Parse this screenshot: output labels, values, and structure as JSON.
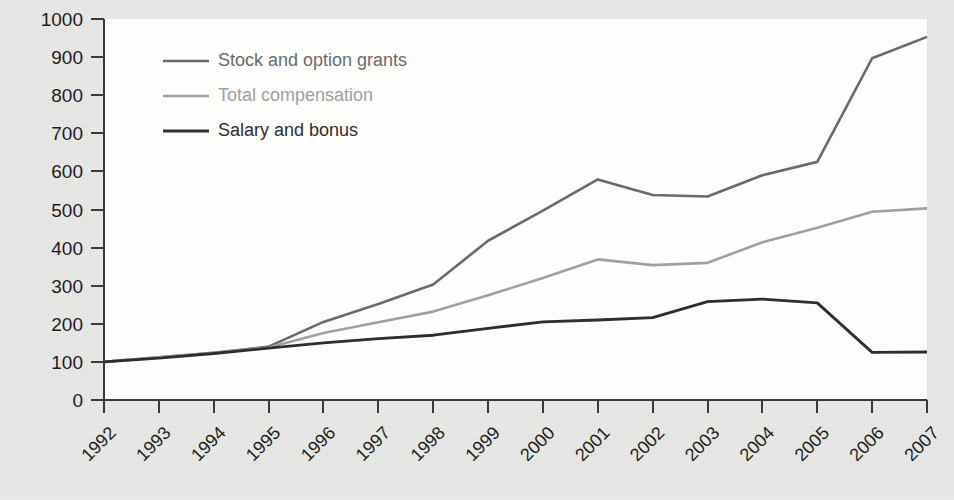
{
  "figure": {
    "background_color": "#e9e9e7",
    "plot_background_color": "#fdfdfc",
    "axis_color": "#3a3a3a"
  },
  "legend": {
    "position": "top-left-inside",
    "entries": [
      {
        "label": "Stock and option grants",
        "color": "#6a6a6a"
      },
      {
        "label": "Total compensation",
        "color": "#a0a0a0"
      },
      {
        "label": "Salary and bonus",
        "color": "#2e2e2e"
      }
    ]
  },
  "chart_data": {
    "type": "line",
    "title": "",
    "subtitle": "",
    "xlabel": "",
    "ylabel": "",
    "grid": false,
    "legend_position": "top-left-inside",
    "categories": [
      "1992",
      "1993",
      "1994",
      "1995",
      "1996",
      "1997",
      "1998",
      "1999",
      "2000",
      "2001",
      "2002",
      "2003",
      "2004",
      "2005",
      "2006",
      "2007"
    ],
    "x": [
      1992,
      1993,
      1994,
      1995,
      1996,
      1997,
      1998,
      1999,
      2000,
      2001,
      2002,
      2003,
      2004,
      2005,
      2006,
      2007
    ],
    "xlim": [
      1992,
      2007
    ],
    "ylim": [
      0,
      1000
    ],
    "ytick_labels": [
      "0",
      "100",
      "200",
      "300",
      "400",
      "500",
      "600",
      "700",
      "800",
      "900",
      "1000"
    ],
    "yticks": [
      0,
      100,
      200,
      300,
      400,
      500,
      600,
      700,
      800,
      900,
      1000
    ],
    "series": [
      {
        "name": "Stock and option grants",
        "color": "#6a6a6a",
        "width": 2.6,
        "values": [
          100,
          112,
          124,
          140,
          205,
          252,
          303,
          418,
          497,
          579,
          538,
          534,
          590,
          625,
          897,
          953
        ]
      },
      {
        "name": "Total compensation",
        "color": "#a0a0a0",
        "width": 2.6,
        "values": [
          100,
          112,
          124,
          138,
          176,
          204,
          232,
          275,
          320,
          369,
          354,
          360,
          414,
          452,
          494,
          503
        ]
      },
      {
        "name": "Salary and bonus",
        "color": "#2e2e2e",
        "width": 2.8,
        "values": [
          100,
          110,
          122,
          136,
          150,
          161,
          170,
          188,
          205,
          210,
          216,
          258,
          265,
          255,
          125,
          126
        ]
      }
    ]
  }
}
